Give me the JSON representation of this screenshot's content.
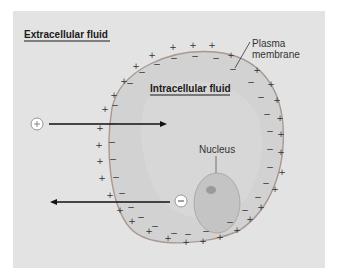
{
  "labels": {
    "extracellular": "Extracellular fluid",
    "intracellular": "Intracellular fluid",
    "plasma_line1": "Plasma",
    "plasma_line2": "membrane",
    "nucleus": "Nucleus"
  },
  "ions": {
    "positive": "+",
    "negative": "−"
  },
  "icons": {
    "positive_ion": "plus-circle-icon",
    "negative_ion": "minus-circle-icon",
    "arrow_in": "arrow-right-icon",
    "arrow_out": "arrow-left-icon"
  },
  "colors": {
    "background": "#e3e3e3",
    "cell_fill": "#d2d2d2",
    "membrane": "#a89890",
    "nucleus_fill": "#c4c4c4",
    "nucleolus": "#9a9a9a",
    "arrow": "#111111"
  }
}
